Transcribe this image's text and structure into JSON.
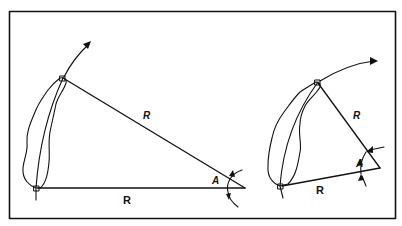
{
  "diagram": {
    "type": "geometry-illustration",
    "frame": {
      "stroke": "#111111",
      "background": "#ffffff"
    },
    "left_panel": {
      "description": "Leaf rotating about apex; isosceles triangle with two sides R and angle A",
      "labels": {
        "hypotenuse": "R",
        "base": "R",
        "angle": "A"
      }
    },
    "right_panel": {
      "description": "Same leaf further rotated; smaller triangle with two sides R and angle A",
      "labels": {
        "upper_side": "R",
        "base": "R",
        "angle": "A"
      }
    }
  }
}
